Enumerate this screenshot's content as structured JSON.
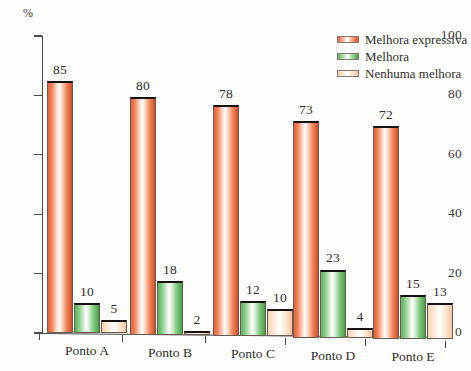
{
  "chart_data": {
    "type": "bar",
    "title": "",
    "xlabel": "",
    "ylabel": "%",
    "ylim": [
      0,
      100
    ],
    "yticks": [
      0,
      20,
      40,
      60,
      80,
      100
    ],
    "grid": false,
    "legend_position": "top-right",
    "categories": [
      "Ponto A",
      "Ponto B",
      "Ponto C",
      "Ponto D",
      "Ponto E"
    ],
    "series": [
      {
        "name": "Melhora expressiva",
        "color": "#ef7d52",
        "values": [
          85,
          80,
          78,
          73,
          72
        ]
      },
      {
        "name": "Melhora",
        "color": "#7cc87c",
        "values": [
          10,
          18,
          12,
          23,
          15
        ]
      },
      {
        "name": "Nenhuma melhora",
        "color": "#fadfc8",
        "values": [
          5,
          2,
          10,
          4,
          13
        ]
      }
    ]
  }
}
